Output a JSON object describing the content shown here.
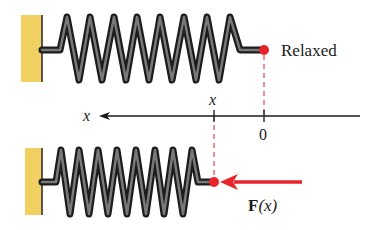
{
  "diagram": {
    "colors": {
      "wall": "#f0d060",
      "wall_edge": "#2a1a10",
      "spring": "#2b2b2b",
      "spring_highlight": "#bdbdbd",
      "marker": "#e8232a",
      "dashed_line": "#d9484e",
      "force_arrow": "#e8232a",
      "axis": "#1a1a1a"
    },
    "top_spring": {
      "state_label": "Relaxed",
      "coils": 8
    },
    "axis": {
      "direction_label": "x",
      "tick_zero_label": "0",
      "tick_x_label": "x"
    },
    "bottom_spring": {
      "coils": 8,
      "force_label_bold": "F",
      "force_label_arg": "(x)"
    }
  }
}
